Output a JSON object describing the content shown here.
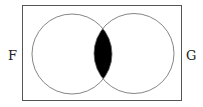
{
  "diagram": {
    "type": "venn",
    "sets": [
      {
        "label": "F",
        "shaded_region": "intersection"
      },
      {
        "label": "G"
      }
    ],
    "shaded": "F ∩ G",
    "colors": {
      "stroke": "#555555",
      "fill_shaded": "#000000",
      "background": "#ffffff"
    }
  },
  "labels": {
    "left": "F",
    "right": "G"
  }
}
